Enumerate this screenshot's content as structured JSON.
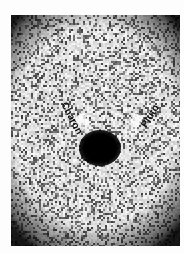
{
  "image": {
    "description": "Negative astronomical photograph showing Pluto and Charon as a dark central blob on a grainy light background",
    "labels": {
      "charon": "Charon",
      "pluto": "Pluto"
    },
    "colors": {
      "background": "#fdfdfd",
      "grain_light": "#e6e6e6",
      "grain_dark": "#333333",
      "object": "#000000"
    }
  }
}
